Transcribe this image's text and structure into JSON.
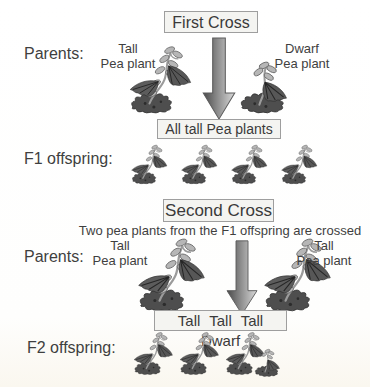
{
  "page": {
    "background": "#fefefd",
    "text_color": "#3f3f3f"
  },
  "colors": {
    "box_background": "#f4f4f1",
    "box_border": "#9e9e9e",
    "arrow_dark": "#4a4a4a",
    "arrow_light": "#d9d9d9",
    "plant_mound": "#4e4e4e",
    "plant_leaflet": "#b6b6b6",
    "plant_leaf": "#575757",
    "plant_stem": "#9b9b9b"
  },
  "first_cross": {
    "title": "First Cross",
    "parents_label": "Parents:",
    "left_parent_line1": "Tall",
    "left_parent_line2": "Pea plant",
    "right_parent_line1": "Dwarf",
    "right_parent_line2": "Pea plant",
    "result": "All tall Pea plants",
    "offspring_label": "F1 offspring:",
    "offspring_count": 4
  },
  "second_cross": {
    "title": "Second Cross",
    "subtitle": "Two pea plants from the F1 offspring are crossed",
    "parents_label": "Parents:",
    "left_parent_line1": "Tall",
    "left_parent_line2": "Pea plant",
    "right_parent_line1": "Tall",
    "right_parent_line2": "Pea plant",
    "result": "Tall Tall Tall Dwarf",
    "offspring_label": "F2 offspring:",
    "offspring_tall_count": 3,
    "offspring_dwarf_count": 1
  }
}
